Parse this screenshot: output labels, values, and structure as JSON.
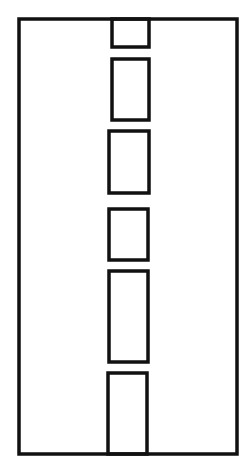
{
  "diagram": {
    "stroke_color": "#111111",
    "background": "#ffffff",
    "stroke_width": 3.5,
    "outer": {
      "x": 19,
      "y": 19,
      "w": 218,
      "h": 435
    },
    "cells": [
      {
        "x": 112,
        "y": 19,
        "w": 37,
        "h": 28
      },
      {
        "x": 112,
        "y": 59,
        "w": 37,
        "h": 61
      },
      {
        "x": 109,
        "y": 131,
        "w": 40,
        "h": 62
      },
      {
        "x": 109,
        "y": 209,
        "w": 39,
        "h": 51
      },
      {
        "x": 109,
        "y": 271,
        "w": 39,
        "h": 91
      },
      {
        "x": 108,
        "y": 373,
        "w": 39,
        "h": 81
      }
    ]
  }
}
